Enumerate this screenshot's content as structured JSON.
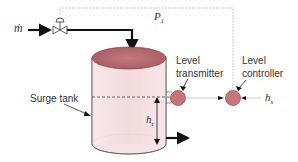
{
  "diagram": {
    "labels": {
      "mass_flow": "ṁ",
      "pressure_signal": "P",
      "pressure_signal_sub": "1",
      "level_transmitter": "Level transmitter",
      "level_transmitter_line1": "Level",
      "level_transmitter_line2": "transmitter",
      "level_controller_line1": "Level",
      "level_controller_line2": "controller",
      "surge_tank": "Surge tank",
      "tank_height": "h",
      "tank_height_sub": "t",
      "setpoint": "h",
      "setpoint_sub": "s"
    },
    "colors": {
      "tank_fill": "#f6e3e6",
      "tank_top": "#b86a70",
      "instrument_fill": "#c97479",
      "line": "#111111",
      "signal_line": "#bbbbbb"
    },
    "components": [
      "inlet-flow",
      "control-valve",
      "surge-tank",
      "level-transmitter",
      "level-controller",
      "outlet-flow",
      "setpoint"
    ]
  }
}
